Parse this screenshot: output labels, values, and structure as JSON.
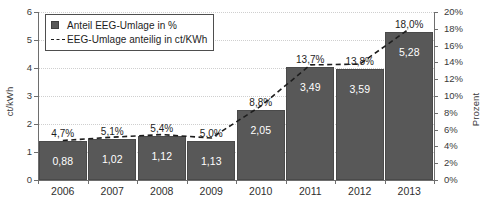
{
  "chart_data": {
    "type": "bar",
    "title": "",
    "subtitle": "",
    "categories": [
      "2006",
      "2007",
      "2008",
      "2009",
      "2010",
      "2011",
      "2012",
      "2013"
    ],
    "series": [
      {
        "name": "Anteil EEG-Umlage in %",
        "kind": "bar",
        "axis": "left",
        "values": [
          1.38,
          1.45,
          1.56,
          1.4,
          2.5,
          4.05,
          3.96,
          5.28
        ],
        "data_labels": [
          "0,88",
          "1,02",
          "1,12",
          "1,13",
          "2,05",
          "3,49",
          "3,59",
          "5,28"
        ]
      },
      {
        "name": "EEG-Umlage anteilig in ct/KWh",
        "kind": "line",
        "axis": "right",
        "values": [
          4.7,
          5.1,
          5.4,
          5.0,
          8.8,
          13.7,
          13.8,
          18.0
        ],
        "data_labels": [
          "4,7%",
          "5,1%",
          "5,4%",
          "5,0%",
          "8,8%",
          "13,7%",
          "13,8%",
          "18,0%"
        ]
      }
    ],
    "xlabel": "",
    "ylabel": "ct/kWh",
    "ylabel_right": "Prozent",
    "ylim": [
      0,
      6
    ],
    "ylim_right": [
      0,
      20
    ],
    "yticks": [
      "0",
      "1",
      "2",
      "3",
      "4",
      "5",
      "6"
    ],
    "yticks_right": [
      "0%",
      "2%",
      "4%",
      "6%",
      "8%",
      "10%",
      "12%",
      "14%",
      "16%",
      "18%",
      "20%"
    ],
    "grid": true,
    "legend_position": "top-left",
    "legend": [
      {
        "label": "Anteil EEG-Umlage in %",
        "marker": "square-swatch-icon",
        "color": "#585858"
      },
      {
        "label": "EEG-Umlage anteilig in ct/KWh",
        "marker": "dashed-line-icon",
        "color": "#1d1d1d"
      }
    ],
    "colors": {
      "bar_fill": "#585858",
      "bar_edge": "#4a4a4a",
      "line": "#1d1d1d",
      "grid": "#cfcfcf",
      "axis": "#6e6e6e",
      "text": "#1d1d1d",
      "value_label_text": "#ffffff"
    }
  }
}
